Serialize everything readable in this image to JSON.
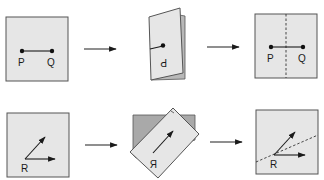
{
  "rows": [
    {
      "name": "segment-reflection",
      "steps": [
        {
          "name": "original",
          "labels": [
            "P",
            "Q"
          ]
        },
        {
          "name": "folded",
          "labels": [
            "P"
          ],
          "mirrored": true
        },
        {
          "name": "unfolded",
          "labels": [
            "P",
            "Q"
          ],
          "fold_line": "vertical dashed"
        }
      ]
    },
    {
      "name": "vector-reflection",
      "steps": [
        {
          "name": "original",
          "labels": [
            "R"
          ]
        },
        {
          "name": "folded",
          "labels": [
            "R"
          ],
          "mirrored": true
        },
        {
          "name": "unfolded",
          "labels": [
            "R"
          ],
          "fold_line": "diagonal dashed"
        }
      ]
    }
  ],
  "labels": {
    "p": "P",
    "q": "Q",
    "r": "R",
    "p_mirror": "P",
    "r_mirror": "R"
  },
  "colors": {
    "paper": "#e6e6e6",
    "paper_shadow": "#a9a9a9",
    "ink": "#1a1a1a"
  }
}
